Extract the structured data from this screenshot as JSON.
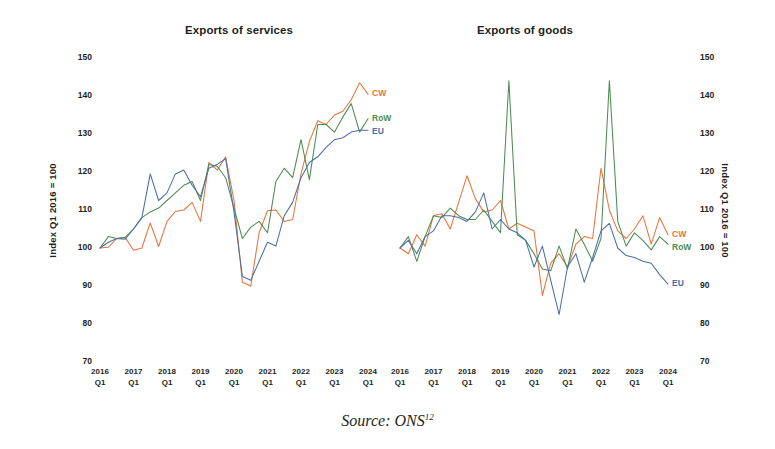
{
  "source_note": {
    "text": "Source: ONS",
    "footnote": "12"
  },
  "axis_title": "Index Q1 2016 = 100",
  "series_labels": {
    "cw": "CW",
    "row": "RoW",
    "eu": "EU"
  },
  "colors": {
    "cw": "#e8743b",
    "row": "#4c8c52",
    "eu": "#4a6fa5",
    "text": "#231f20",
    "background": "#ffffff"
  },
  "chart_data": [
    {
      "type": "line",
      "title": "Exports of services",
      "xlabel": "",
      "ylabel": "Index Q1 2016 = 100",
      "ylim": [
        70,
        150
      ],
      "yticks": [
        70,
        80,
        90,
        100,
        110,
        120,
        130,
        140,
        150
      ],
      "xticks": [
        "2016 Q1",
        "2017 Q1",
        "2018 Q1",
        "2019 Q1",
        "2020 Q1",
        "2021 Q1",
        "2022 Q1",
        "2023 Q1",
        "2024 Q1"
      ],
      "x": [
        "2016 Q1",
        "2016 Q2",
        "2016 Q3",
        "2016 Q4",
        "2017 Q1",
        "2017 Q2",
        "2017 Q3",
        "2017 Q4",
        "2018 Q1",
        "2018 Q2",
        "2018 Q3",
        "2018 Q4",
        "2019 Q1",
        "2019 Q2",
        "2019 Q3",
        "2019 Q4",
        "2020 Q1",
        "2020 Q2",
        "2020 Q3",
        "2020 Q4",
        "2021 Q1",
        "2021 Q2",
        "2021 Q3",
        "2021 Q4",
        "2022 Q1",
        "2022 Q2",
        "2022 Q3",
        "2022 Q4",
        "2023 Q1",
        "2023 Q2",
        "2023 Q3",
        "2023 Q4",
        "2024 Q1"
      ],
      "grid": false,
      "legend": "inline-right",
      "series": [
        {
          "name": "CW",
          "key": "cw",
          "color": "#e8743b",
          "values": [
            100.0,
            100.2,
            102.5,
            102.8,
            99.4,
            100.0,
            106.6,
            100.4,
            107.0,
            109.6,
            110.0,
            112.0,
            107.0,
            122.5,
            120.5,
            124.0,
            112.5,
            91.0,
            90.0,
            104.0,
            109.8,
            110.0,
            107.0,
            107.5,
            119.5,
            128.0,
            133.5,
            132.5,
            135.0,
            136.0,
            139.0,
            143.5,
            140.5
          ]
        },
        {
          "name": "RoW",
          "key": "row",
          "color": "#4c8c52",
          "values": [
            100.0,
            103.0,
            102.5,
            102.8,
            105.0,
            108.0,
            109.5,
            110.5,
            112.5,
            114.5,
            116.5,
            117.5,
            112.5,
            122.0,
            121.5,
            118.5,
            110.5,
            102.5,
            105.5,
            107.0,
            104.0,
            117.5,
            121.0,
            118.5,
            128.5,
            118.0,
            132.5,
            132.5,
            130.5,
            134.5,
            138.0,
            130.5,
            134.0
          ]
        },
        {
          "name": "EU",
          "key": "eu",
          "color": "#4a6fa5",
          "values": [
            100.0,
            101.5,
            102.5,
            102.3,
            105.0,
            108.0,
            119.5,
            112.5,
            114.5,
            119.5,
            120.5,
            116.5,
            113.5,
            121.0,
            122.0,
            123.5,
            109.5,
            92.5,
            91.5,
            96.5,
            101.5,
            100.5,
            108.5,
            112.0,
            118.5,
            122.5,
            124.0,
            126.5,
            128.5,
            129.0,
            130.5,
            131.0,
            131.0
          ]
        }
      ]
    },
    {
      "type": "line",
      "title": "Exports of goods",
      "xlabel": "",
      "ylabel": "Index Q1 2016 = 100",
      "ylim": [
        70,
        150
      ],
      "yticks": [
        70,
        80,
        90,
        100,
        110,
        120,
        130,
        140,
        150
      ],
      "xticks": [
        "2016 Q1",
        "2017 Q1",
        "2018 Q1",
        "2019 Q1",
        "2020 Q1",
        "2021 Q1",
        "2022 Q1",
        "2023 Q1",
        "2024 Q1"
      ],
      "x": [
        "2016 Q1",
        "2016 Q2",
        "2016 Q3",
        "2016 Q4",
        "2017 Q1",
        "2017 Q2",
        "2017 Q3",
        "2017 Q4",
        "2018 Q1",
        "2018 Q2",
        "2018 Q3",
        "2018 Q4",
        "2019 Q1",
        "2019 Q2",
        "2019 Q3",
        "2019 Q4",
        "2020 Q1",
        "2020 Q2",
        "2020 Q3",
        "2020 Q4",
        "2021 Q1",
        "2021 Q2",
        "2021 Q3",
        "2021 Q4",
        "2022 Q1",
        "2022 Q2",
        "2022 Q3",
        "2022 Q4",
        "2023 Q1",
        "2023 Q2",
        "2023 Q3",
        "2023 Q4",
        "2024 Q1"
      ],
      "grid": false,
      "legend": "inline-right",
      "series": [
        {
          "name": "CW",
          "key": "cw",
          "color": "#e8743b",
          "values": [
            100.0,
            98.5,
            103.5,
            100.5,
            108.5,
            109.0,
            105.0,
            112.0,
            119.0,
            113.0,
            109.5,
            110.0,
            112.5,
            105.0,
            106.5,
            105.5,
            104.5,
            87.5,
            96.0,
            98.5,
            95.0,
            101.0,
            103.0,
            102.5,
            121.0,
            110.0,
            104.5,
            102.5,
            105.0,
            108.5,
            101.0,
            108.0,
            103.5
          ]
        },
        {
          "name": "RoW",
          "key": "row",
          "color": "#4c8c52",
          "values": [
            100.0,
            103.0,
            96.5,
            103.0,
            108.5,
            108.0,
            110.5,
            108.5,
            107.5,
            107.5,
            110.0,
            107.0,
            104.0,
            144.0,
            103.5,
            102.0,
            98.5,
            94.5,
            94.0,
            100.5,
            94.5,
            105.0,
            101.0,
            96.5,
            102.5,
            144.0,
            107.0,
            100.5,
            104.0,
            102.0,
            99.5,
            103.0,
            101.0
          ]
        },
        {
          "name": "EU",
          "key": "eu",
          "color": "#4a6fa5",
          "values": [
            100.0,
            102.0,
            98.5,
            103.0,
            104.5,
            108.5,
            108.5,
            108.0,
            107.0,
            109.5,
            114.5,
            105.0,
            107.5,
            105.0,
            104.0,
            102.0,
            95.0,
            100.5,
            91.5,
            82.5,
            95.0,
            98.5,
            91.0,
            97.5,
            104.5,
            106.5,
            100.0,
            98.0,
            97.5,
            96.5,
            96.0,
            93.0,
            90.5
          ]
        }
      ]
    }
  ]
}
